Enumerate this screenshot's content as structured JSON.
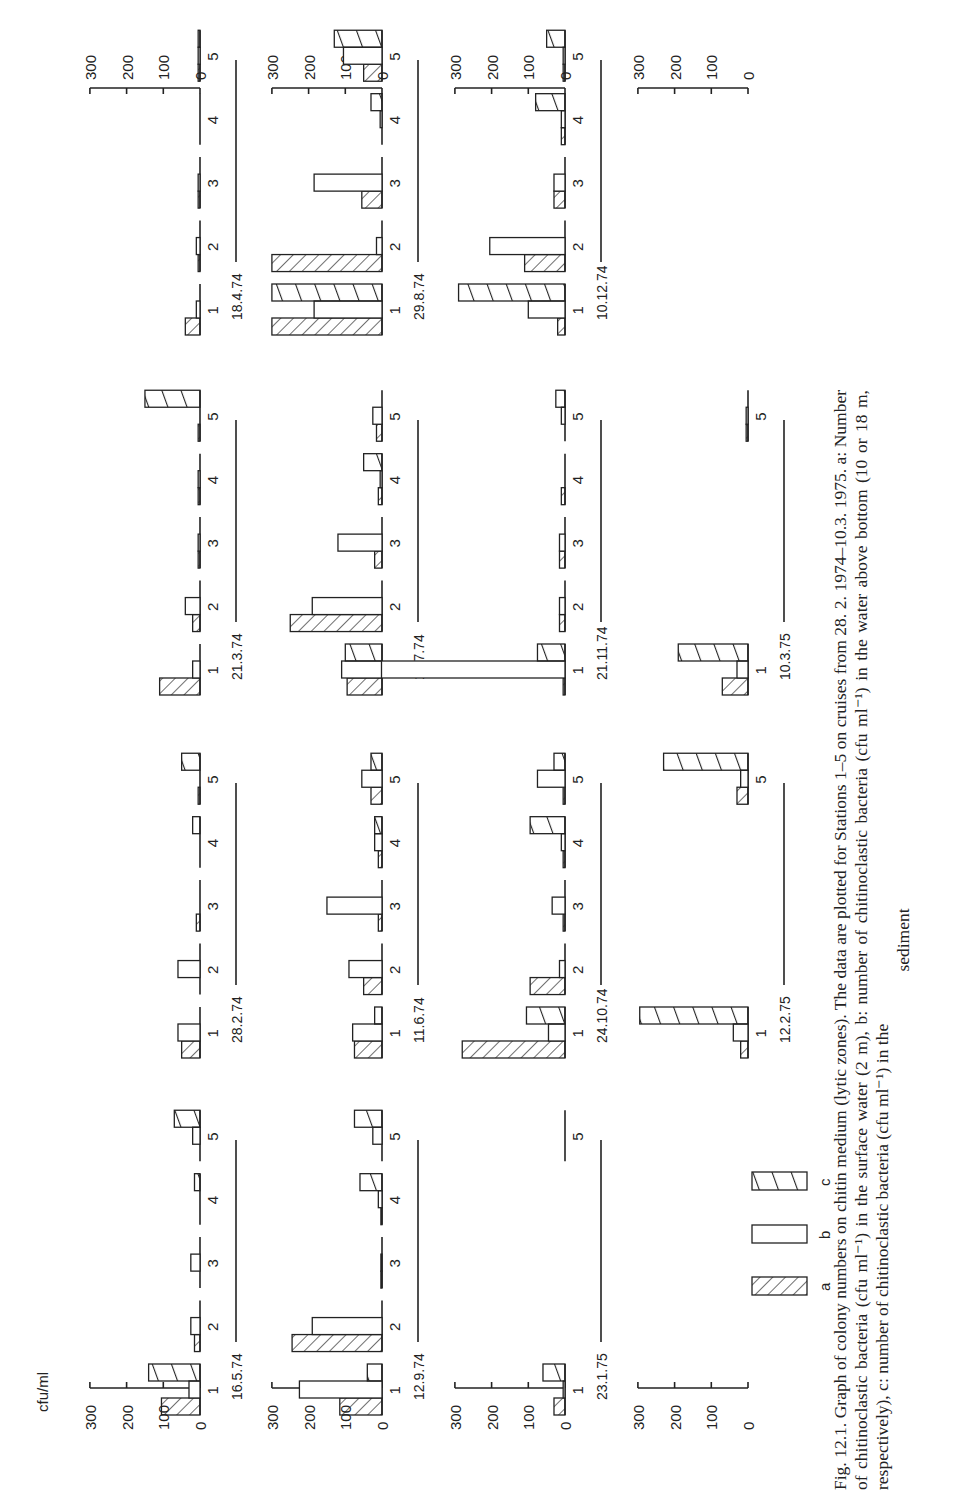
{
  "figure": {
    "unit_label": "cfu/ml",
    "axis_ticks": [
      "300",
      "200",
      "100",
      "0"
    ],
    "legend": [
      {
        "key": "a",
        "pattern": "hatch-backslash"
      },
      {
        "key": "b",
        "pattern": "open"
      },
      {
        "key": "c",
        "pattern": "hatch-slash-wide"
      }
    ],
    "caption_lines": [
      "Fig. 12.1. Graph of colony numbers on chitin medium (lytic zones). The data are plotted for Stations 1–5 on cruises from 28. 2. 1974–10.3. 1975. a: Number of chitinoclastic bacteria (cfu ml⁻¹) in the surface water (2 m), b: number of chitinoclastic bacteria (cfu ml⁻¹) in the water above bottom (10 or 18 m, respectively), c: number of chitinoclastic bacteria (cfu ml⁻¹) in the",
      "sediment"
    ]
  },
  "chart_data": {
    "type": "bar",
    "title": "Graph of colony numbers on chitin medium (lytic zones)",
    "ylabel": "cfu/ml",
    "xlabel": "Station",
    "ylim": [
      0,
      300
    ],
    "yticks": [
      0,
      100,
      200,
      300
    ],
    "categories": [
      "1",
      "2",
      "3",
      "4",
      "5"
    ],
    "series_names": [
      "a: surface water (2 m)",
      "b: water above bottom (10 or 18 m)",
      "c: sediment"
    ],
    "panels": [
      {
        "date": "16.5.74",
        "row": 0,
        "col": 0,
        "stations": [
          1,
          2,
          3,
          4,
          5
        ],
        "a": [
          105,
          15,
          0,
          0,
          0
        ],
        "b": [
          30,
          25,
          25,
          0,
          20
        ],
        "c": [
          140,
          0,
          0,
          15,
          70
        ]
      },
      {
        "date": "12.9.74",
        "row": 1,
        "col": 0,
        "stations": [
          1,
          2,
          3,
          4,
          5
        ],
        "a": [
          115,
          245,
          3,
          3,
          0
        ],
        "b": [
          225,
          190,
          3,
          10,
          25
        ],
        "c": [
          40,
          0,
          0,
          60,
          75
        ]
      },
      {
        "date": "23.1.75",
        "row": 2,
        "col": 0,
        "stations": [
          1,
          5
        ],
        "a": [
          30,
          0
        ],
        "b": [
          5,
          0
        ],
        "c": [
          60,
          0
        ]
      },
      {
        "date": "28.2.74",
        "row": 0,
        "col": 1,
        "stations": [
          1,
          2,
          3,
          4,
          5
        ],
        "a": [
          50,
          0,
          10,
          0,
          5
        ],
        "b": [
          60,
          60,
          0,
          0,
          0
        ],
        "c": [
          0,
          0,
          0,
          20,
          50
        ]
      },
      {
        "date": "11.6.74",
        "row": 1,
        "col": 1,
        "stations": [
          1,
          2,
          3,
          4,
          5
        ],
        "a": [
          75,
          50,
          10,
          10,
          30
        ],
        "b": [
          80,
          90,
          150,
          20,
          55
        ],
        "c": [
          20,
          0,
          0,
          20,
          30
        ]
      },
      {
        "date": "24.10.74",
        "row": 2,
        "col": 1,
        "stations": [
          1,
          2,
          3,
          4,
          5
        ],
        "a": [
          280,
          95,
          5,
          5,
          5
        ],
        "b": [
          45,
          15,
          35,
          10,
          75
        ],
        "c": [
          105,
          0,
          0,
          95,
          30
        ]
      },
      {
        "date": "12.2.75",
        "row": 3,
        "col": 1,
        "stations": [
          1,
          5
        ],
        "a": [
          20,
          30
        ],
        "b": [
          40,
          20
        ],
        "c": [
          295,
          230
        ]
      },
      {
        "date": "21.3.74",
        "row": 0,
        "col": 2,
        "stations": [
          1,
          2,
          3,
          4,
          5
        ],
        "a": [
          110,
          20,
          5,
          5,
          5
        ],
        "b": [
          20,
          40,
          5,
          5,
          0
        ],
        "c": [
          0,
          0,
          0,
          0,
          150
        ]
      },
      {
        "date": "11.7.74",
        "row": 1,
        "col": 2,
        "stations": [
          1,
          2,
          3,
          4,
          5
        ],
        "a": [
          95,
          250,
          20,
          10,
          15
        ],
        "b": [
          110,
          190,
          120,
          5,
          25
        ],
        "c": [
          100,
          0,
          0,
          50,
          0
        ]
      },
      {
        "date": "21.11.74",
        "row": 2,
        "col": 2,
        "stations": [
          1,
          2,
          3,
          4,
          5
        ],
        "a": [
          5,
          15,
          15,
          10,
          0
        ],
        "b": [
          500,
          15,
          15,
          0,
          10
        ],
        "c": [
          75,
          0,
          0,
          0,
          25
        ]
      },
      {
        "date": "10.3.75",
        "row": 3,
        "col": 2,
        "stations": [
          1,
          5
        ],
        "a": [
          70,
          5
        ],
        "b": [
          30,
          5
        ],
        "c": [
          190,
          0
        ]
      },
      {
        "date": "18.4.74",
        "row": 0,
        "col": 3,
        "stations": [
          1,
          2,
          3,
          4,
          5
        ],
        "a": [
          40,
          5,
          5,
          0,
          5
        ],
        "b": [
          10,
          10,
          5,
          0,
          5
        ],
        "c": [
          0,
          0,
          0,
          0,
          5
        ]
      },
      {
        "date": "29.8.74",
        "row": 1,
        "col": 3,
        "stations": [
          1,
          2,
          3,
          4,
          5
        ],
        "a": [
          300,
          300,
          55,
          0,
          50
        ],
        "b": [
          185,
          15,
          185,
          5,
          105
        ],
        "c": [
          300,
          0,
          0,
          30,
          130
        ]
      },
      {
        "date": "10.12.74",
        "row": 2,
        "col": 3,
        "stations": [
          1,
          2,
          3,
          4,
          5
        ],
        "a": [
          20,
          110,
          30,
          10,
          5
        ],
        "b": [
          100,
          205,
          30,
          10,
          5
        ],
        "c": [
          290,
          0,
          0,
          80,
          50
        ]
      }
    ]
  }
}
